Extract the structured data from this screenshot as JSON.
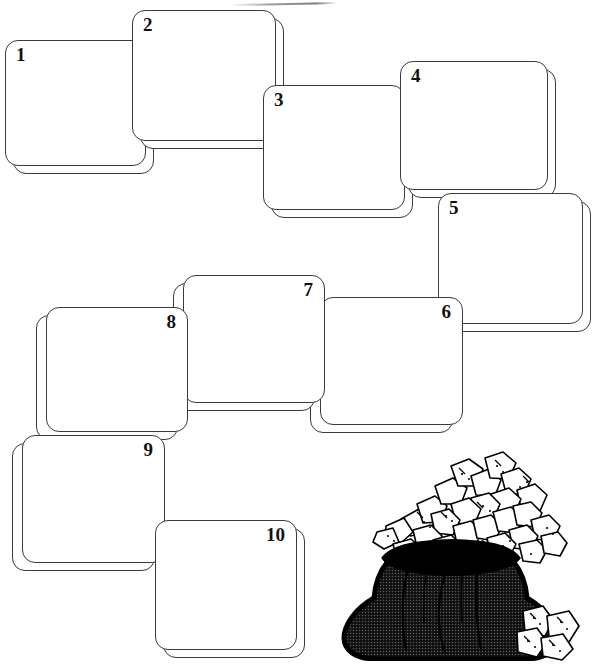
{
  "page": {
    "background_color": "#ffffff",
    "line_color": "#3a3a3a",
    "width": 597,
    "height": 664
  },
  "cards": [
    {
      "number": "1",
      "x": 5,
      "y": 40,
      "w": 141,
      "h": 126,
      "shadow_dx": 8,
      "shadow_dy": 8,
      "num_align": "left"
    },
    {
      "number": "2",
      "x": 132,
      "y": 10,
      "w": 144,
      "h": 131,
      "shadow_dx": 8,
      "shadow_dy": 8,
      "num_align": "left"
    },
    {
      "number": "3",
      "x": 263,
      "y": 85,
      "w": 142,
      "h": 125,
      "shadow_dx": 8,
      "shadow_dy": 8,
      "num_align": "left"
    },
    {
      "number": "4",
      "x": 400,
      "y": 61,
      "w": 148,
      "h": 129,
      "shadow_dx": 8,
      "shadow_dy": 8,
      "num_align": "left"
    },
    {
      "number": "5",
      "x": 438,
      "y": 193,
      "w": 145,
      "h": 131,
      "shadow_dx": 8,
      "shadow_dy": 8,
      "num_align": "left"
    },
    {
      "number": "6",
      "x": 320,
      "y": 297,
      "w": 143,
      "h": 128,
      "shadow_dx": -10,
      "shadow_dy": 8,
      "num_align": "right"
    },
    {
      "number": "7",
      "x": 183,
      "y": 275,
      "w": 142,
      "h": 128,
      "shadow_dx": -10,
      "shadow_dy": 8,
      "num_align": "right"
    },
    {
      "number": "8",
      "x": 46,
      "y": 307,
      "w": 142,
      "h": 125,
      "shadow_dx": -10,
      "shadow_dy": 8,
      "num_align": "right"
    },
    {
      "number": "9",
      "x": 22,
      "y": 435,
      "w": 143,
      "h": 128,
      "shadow_dx": -10,
      "shadow_dy": 8,
      "num_align": "right"
    },
    {
      "number": "10",
      "x": 155,
      "y": 520,
      "w": 142,
      "h": 130,
      "shadow_dx": 8,
      "shadow_dy": 8,
      "num_align": "right"
    }
  ],
  "illustration": {
    "name": "sack-of-rocks",
    "description": "Dark halftone-filled sack overflowing with white irregular rocks, a few spilled rocks at lower right",
    "bag_fill": "#2a2a2a",
    "rock_fill": "#ffffff",
    "outline_color": "#000000",
    "spilled_rock_count": 4
  }
}
